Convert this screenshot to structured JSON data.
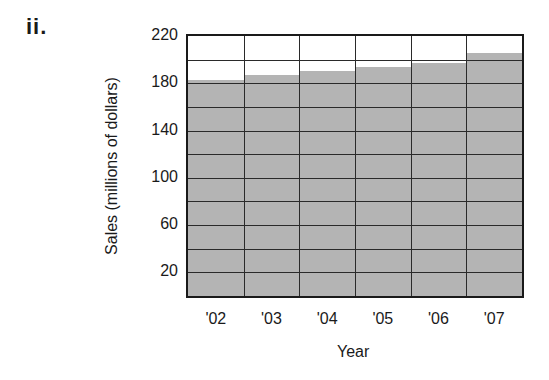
{
  "figure_label": "ii.",
  "chart_data": {
    "type": "bar",
    "title": "",
    "xlabel": "Year",
    "ylabel": "Sales (millions of dollars)",
    "categories": [
      "'02",
      "'03",
      "'04",
      "'05",
      "'06",
      "'07"
    ],
    "values": [
      183,
      187,
      190,
      194,
      197,
      206
    ],
    "ylim": [
      0,
      220
    ],
    "y_tick_labels": [
      "20",
      "60",
      "100",
      "140",
      "180",
      "220"
    ],
    "y_tick_values": [
      20,
      60,
      100,
      140,
      180,
      220
    ],
    "gridline_step": 20,
    "grid": true,
    "legend": null,
    "bar_color": "#b4b4b4"
  }
}
